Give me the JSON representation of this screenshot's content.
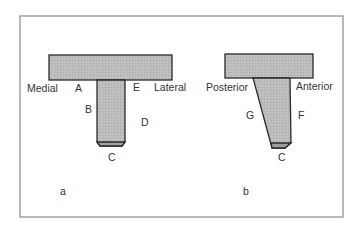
{
  "figure": {
    "colors": {
      "fill": "#b9b9b9",
      "stroke": "#2a2a2a",
      "frame": "#8a8a8a",
      "text": "#333333"
    },
    "panel_a": {
      "caption": "a",
      "labels": {
        "medial": "Medial",
        "lateral": "Lateral",
        "A": "A",
        "B": "B",
        "C": "C",
        "D": "D",
        "E": "E"
      }
    },
    "panel_b": {
      "caption": "b",
      "labels": {
        "posterior": "Posterior",
        "anterior": "Anterior",
        "C": "C",
        "F": "F",
        "G": "G"
      }
    }
  }
}
